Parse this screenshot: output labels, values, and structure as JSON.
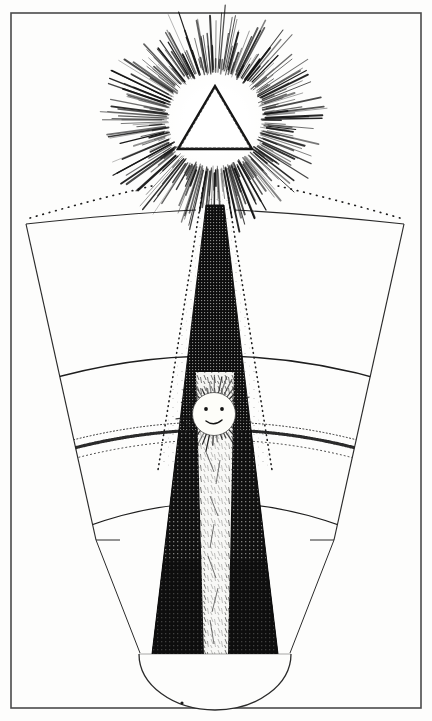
{
  "artwork": {
    "title": "Radiant Delta and Descending Ray",
    "style": "engraving",
    "medium": "pen-and-ink line engraving, black on cream",
    "orientation": "portrait",
    "canvas": {
      "width": 432,
      "height": 721
    },
    "palette": {
      "paper": "#fdfdfc",
      "ink": "#111111",
      "line": "#2a2a2a",
      "frame": "#4a4a4a",
      "halftone": "#1a1a1a"
    }
  },
  "frame": {
    "name": "plate-border",
    "x": 11,
    "y": 13,
    "width": 410,
    "height": 695,
    "stroke_width": 1.6,
    "stroke": "#4a4a4a"
  },
  "elements": {
    "glory": {
      "label": "radiant starburst glory",
      "center_x": 215,
      "center_y": 120,
      "inner_radius": 46,
      "outer_radius": 112,
      "ray_count": 300,
      "description": "dense halo of fine tapered ink rays emanating in all directions"
    },
    "delta": {
      "label": "equilateral triangle (delta)",
      "center_x": 215,
      "center_y": 122,
      "apex_x": 215,
      "apex_y": 86,
      "left_x": 179,
      "left_y": 148,
      "right_x": 251,
      "right_y": 148,
      "fill": "none",
      "stroke": "#151515",
      "stroke_width": 2.2,
      "description": "open triangle outlined in a rough hand-engraved stroke, void of light at centre"
    },
    "fan": {
      "label": "outer fan / mantle",
      "apex_x": 215,
      "apex_y": 118,
      "top_left_x": 26,
      "top_left_y": 224,
      "top_right_x": 404,
      "top_right_y": 224,
      "bottom_left_x": 96,
      "bottom_left_y": 540,
      "bottom_right_x": 334,
      "bottom_right_y": 540,
      "stroke": "#2a2a2a",
      "stroke_width": 1.1,
      "top_edges_dotted": true,
      "description": "broad splayed skirt with solid straight sides and dotted upper shoulders"
    },
    "arcs": [
      {
        "name": "upper-arc",
        "y_center": 352,
        "style": "solid",
        "stroke_width": 1.2
      },
      {
        "name": "stipple-band-arc",
        "y_center": 418,
        "style": "stippled-band",
        "stroke_width": 3.0
      },
      {
        "name": "lower-arc",
        "y_center": 497,
        "style": "solid",
        "stroke_width": 1.0
      }
    ],
    "dark_cone": {
      "label": "descending dark ray",
      "top_x": 215,
      "top_y": 205,
      "top_half_width": 9,
      "bottom_y": 654,
      "bottom_half_width": 63,
      "fill": "#121212",
      "texture": "cross-hatch halftone",
      "description": "inverted wedge of dense black hatching widening as it descends"
    },
    "light_core": {
      "label": "inner luminous shaft",
      "top_y": 380,
      "bottom_y": 654,
      "top_half_width": 22,
      "bottom_half_width": 11,
      "description": "pale scratched channel of light running down the centre of the dark ray"
    },
    "inner_dotted_cone": {
      "label": "dotted penumbra cone",
      "apex_x": 215,
      "apex_y": 180,
      "left_bottom_x": 150,
      "left_bottom_y": 430,
      "right_bottom_x": 280,
      "right_bottom_y": 430,
      "style": "dotted",
      "description": "faint dotted outline of a wider secondary cone with stippled shading inside"
    },
    "sun_face": {
      "label": "little sun with a face",
      "center_x": 214,
      "center_y": 414,
      "disc_radius": 22,
      "ray_length": 16,
      "ray_count": 40,
      "features": [
        "left-eye",
        "right-eye",
        "smiling-mouth"
      ],
      "description": "small anthropomorphic sun set within the dark ray, rays bristling outward"
    },
    "bowl": {
      "label": "receiving basin",
      "center_x": 215,
      "center_y": 654,
      "radius_x": 76,
      "radius_y": 56,
      "stroke": "#2a2a2a",
      "stroke_width": 1.2,
      "description": "semicircular vessel closing the base of the descending ray"
    }
  },
  "texts": []
}
